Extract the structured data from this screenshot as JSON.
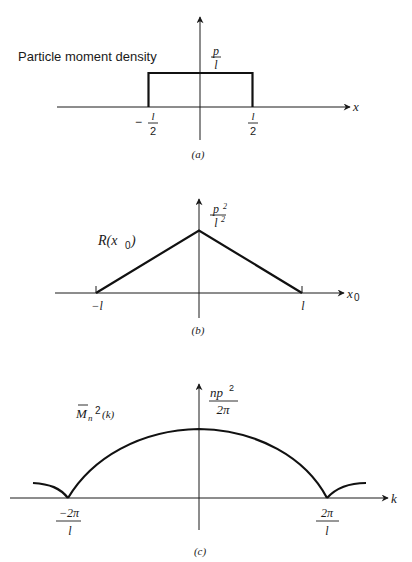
{
  "panels": [
    {
      "id": "a",
      "caption": "(a)",
      "title": "Particle moment density",
      "y_label_num": "p",
      "y_label_den": "l",
      "x_axis_label": "x",
      "ticks": [
        {
          "sign": "−",
          "num": "l",
          "den": "2"
        },
        {
          "sign": "",
          "num": "l",
          "den": "2"
        }
      ],
      "shape": "rectangle",
      "description": "Rectangular pulse of height p/l from -l/2 to l/2"
    },
    {
      "id": "b",
      "caption": "(b)",
      "function_label": "R(x",
      "function_sub": "0",
      "function_close": ")",
      "y_label_num": "p",
      "y_label_num_sup": "2",
      "y_label_den": "l",
      "y_label_den_sup": "2",
      "x_axis_label": "x",
      "x_axis_sub": "0",
      "ticks": [
        "−l",
        "l"
      ],
      "shape": "triangle",
      "description": "Triangular autocorrelation with peak p²/l² at 0, zero at ±l"
    },
    {
      "id": "c",
      "caption": "(c)",
      "function_label": "M",
      "function_sub": "n",
      "function_sup": "2",
      "function_arg": "(k)",
      "y_label_num": "np",
      "y_label_num_sup": "2",
      "y_label_den": "2π",
      "x_axis_label": "k",
      "ticks": [
        {
          "num": "−2π",
          "den": "l"
        },
        {
          "num": "2π",
          "den": "l"
        }
      ],
      "shape": "sinc-squared",
      "description": "Spectrum with main lobe peak np²/2π at k=0, zeros at ±2π/l, side lobes beyond"
    }
  ]
}
